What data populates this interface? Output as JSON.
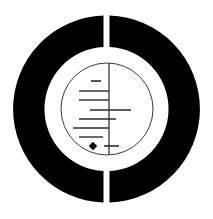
{
  "canvas": {
    "width": 213,
    "height": 219,
    "background_color": "#ffffff"
  },
  "figure": {
    "name": "gapped-annulus-with-tick-dial",
    "colors": {
      "ring_fill": "#000000",
      "page_background": "#ffffff",
      "inner_disc_fill": "#ffffff",
      "inner_circle_stroke": "#3a3a3a",
      "axis_stroke": "#444444",
      "tick_stroke": "#2b2b2b",
      "marker_fill": "#000000"
    },
    "outer_ring": {
      "center_x": 106.5,
      "center_y": 109,
      "outer_radius": 93.5,
      "inner_radius": 62,
      "gap_top_x_start": 105.5,
      "gap_top_x_end": 111.5,
      "gap_bottom_x_start": 105.5,
      "gap_bottom_x_end": 111.5
    },
    "inner_circle": {
      "center_x": 107,
      "center_y": 109,
      "radius": 46,
      "stroke_width": 1
    },
    "axis": {
      "x": 109,
      "y_top": 63,
      "y_bottom": 155,
      "stroke_width": 1.4
    },
    "ticks": [
      {
        "id": "tick-1",
        "y": 81,
        "x_start": 91,
        "x_end": 101,
        "stroke_width": 1.6
      },
      {
        "id": "tick-2",
        "y": 91,
        "x_start": 79,
        "x_end": 109,
        "stroke_width": 1.4
      },
      {
        "id": "tick-3",
        "y": 100,
        "x_start": 79,
        "x_end": 109,
        "stroke_width": 1.4
      },
      {
        "id": "tick-4",
        "y": 110,
        "x_start": 90,
        "x_end": 131,
        "stroke_width": 1.6
      },
      {
        "id": "tick-5",
        "y": 119,
        "x_start": 79,
        "x_end": 116,
        "stroke_width": 1.4
      },
      {
        "id": "tick-6",
        "y": 128,
        "x_start": 73,
        "x_end": 109,
        "stroke_width": 1.4
      },
      {
        "id": "tick-7",
        "y": 137,
        "x_start": 79,
        "x_end": 103,
        "stroke_width": 1.4
      },
      {
        "id": "tick-8",
        "y": 146,
        "x_start": 104,
        "x_end": 119,
        "stroke_width": 1.6
      }
    ],
    "marker": {
      "id": "data-point-marker",
      "shape": "diamond",
      "center_x": 93,
      "center_y": 146,
      "radius": 4.2
    }
  }
}
